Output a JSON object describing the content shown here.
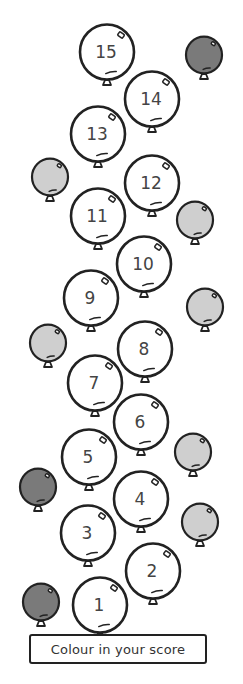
{
  "worksheet": {
    "instruction_label": "Colour in your score",
    "colors": {
      "outline": "#222222",
      "numbered_fill": "#ffffff",
      "decor_dark": "#7a7a7a",
      "decor_light": "#cfcfcf",
      "number_text": "#444444"
    },
    "numbered_balloons": [
      {
        "label": "1",
        "cx": 100,
        "cy": 605
      },
      {
        "label": "2",
        "cx": 153,
        "cy": 571
      },
      {
        "label": "3",
        "cx": 88,
        "cy": 533
      },
      {
        "label": "4",
        "cx": 141,
        "cy": 499
      },
      {
        "label": "5",
        "cx": 89,
        "cy": 457
      },
      {
        "label": "6",
        "cx": 141,
        "cy": 422
      },
      {
        "label": "7",
        "cx": 95,
        "cy": 383
      },
      {
        "label": "8",
        "cx": 145,
        "cy": 349
      },
      {
        "label": "9",
        "cx": 91,
        "cy": 298
      },
      {
        "label": "10",
        "cx": 144,
        "cy": 264
      },
      {
        "label": "11",
        "cx": 98,
        "cy": 216
      },
      {
        "label": "12",
        "cx": 152,
        "cy": 183
      },
      {
        "label": "13",
        "cx": 98,
        "cy": 134
      },
      {
        "label": "14",
        "cx": 152,
        "cy": 99
      },
      {
        "label": "15",
        "cx": 107,
        "cy": 52
      }
    ],
    "decorative_balloons": [
      {
        "shade": "dark",
        "cx": 204,
        "cy": 55
      },
      {
        "shade": "light",
        "cx": 50,
        "cy": 177
      },
      {
        "shade": "light",
        "cx": 195,
        "cy": 220
      },
      {
        "shade": "light",
        "cx": 205,
        "cy": 307
      },
      {
        "shade": "light",
        "cx": 48,
        "cy": 343
      },
      {
        "shade": "light",
        "cx": 193,
        "cy": 452
      },
      {
        "shade": "dark",
        "cx": 38,
        "cy": 487
      },
      {
        "shade": "light",
        "cx": 200,
        "cy": 522
      },
      {
        "shade": "dark",
        "cx": 41,
        "cy": 602
      }
    ]
  }
}
